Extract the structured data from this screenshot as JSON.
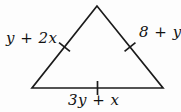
{
  "figure": {
    "type": "geometry-diagram",
    "shape": "triangle",
    "labels": {
      "left_side": "y + 2x",
      "right_side": "8 + y",
      "bottom_side": "3y + x"
    },
    "geometry": {
      "vertices": {
        "apex": [
          97,
          6
        ],
        "bottom_left": [
          32,
          88
        ],
        "bottom_right": [
          163,
          88
        ]
      },
      "tick_half_length": 7
    },
    "colors": {
      "line": "#1b1b1b",
      "text": "#111111",
      "background": "#fdfdfd"
    }
  }
}
